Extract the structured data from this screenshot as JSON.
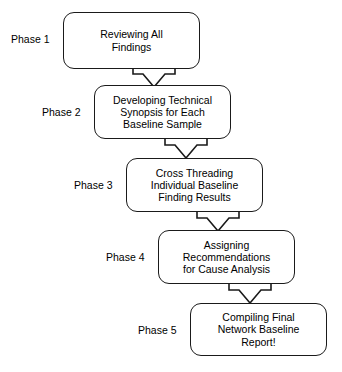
{
  "diagram": {
    "type": "flowchart",
    "orientation": "vertical-cascade",
    "colors": {
      "stroke": "#1a1a1a",
      "fill": "#ffffff",
      "text": "#000000"
    },
    "nodes": [
      {
        "id": "phase-1",
        "phase_label": "Phase 1",
        "text": "Reviewing All\nFindings",
        "x": 63,
        "y": 12,
        "width": 137,
        "height": 57,
        "label_x": 11,
        "label_y": 33
      },
      {
        "id": "phase-2",
        "phase_label": "Phase 2",
        "text": "Developing Technical\nSynopsis for Each\nBaseline Sample",
        "x": 94,
        "y": 85,
        "width": 137,
        "height": 54,
        "label_x": 42,
        "label_y": 106
      },
      {
        "id": "phase-3",
        "phase_label": "Phase 3",
        "text": "Cross Threading\nIndividual Baseline\nFinding Results",
        "x": 126,
        "y": 158,
        "width": 137,
        "height": 54,
        "label_x": 74,
        "label_y": 179
      },
      {
        "id": "phase-4",
        "phase_label": "Phase 4",
        "text": "Assigning\nRecommendations\nfor Cause Analysis",
        "x": 158,
        "y": 230,
        "width": 137,
        "height": 54,
        "label_x": 106,
        "label_y": 251
      },
      {
        "id": "phase-5",
        "phase_label": "Phase 5",
        "text": "Compiling Final\nNetwork Baseline\nReport!",
        "x": 190,
        "y": 303,
        "width": 137,
        "height": 53,
        "label_x": 138,
        "label_y": 324
      }
    ],
    "connectors": [
      {
        "id": "arrow-1-2",
        "from": "phase-1",
        "to": "phase-2",
        "shape": "block-down-arrow",
        "x": 131,
        "y": 66,
        "width": 46,
        "height": 23
      },
      {
        "id": "arrow-2-3",
        "from": "phase-2",
        "to": "phase-3",
        "shape": "block-down-arrow",
        "x": 163,
        "y": 137,
        "width": 46,
        "height": 23
      },
      {
        "id": "arrow-3-4",
        "from": "phase-3",
        "to": "phase-4",
        "shape": "block-down-arrow",
        "x": 195,
        "y": 210,
        "width": 46,
        "height": 23
      },
      {
        "id": "arrow-4-5",
        "from": "phase-4",
        "to": "phase-5",
        "shape": "block-down-arrow",
        "x": 227,
        "y": 282,
        "width": 46,
        "height": 23
      }
    ]
  }
}
